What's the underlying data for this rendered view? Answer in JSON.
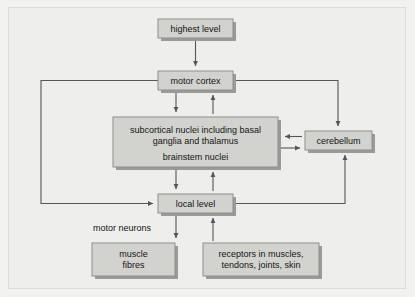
{
  "figure": {
    "background_color": "#eeeeec",
    "box_fill_color": "#d2d2cf",
    "box_border_color": "#8e8e8b",
    "box_shadow_color": "#9a9a97",
    "connector_color": "#55555a",
    "text_color": "#141414"
  },
  "nodes": {
    "highest_level": {
      "label": "highest level",
      "x": 158,
      "y": 19,
      "w": 75,
      "h": 19
    },
    "motor_cortex": {
      "label": "motor cortex",
      "x": 158,
      "y": 71,
      "w": 75,
      "h": 19
    },
    "subcortical": {
      "line1": "subcortical nuclei including basal",
      "line2": "ganglia and thalamus",
      "line3": "brainstem nuclei",
      "x": 113,
      "y": 117,
      "w": 165,
      "h": 50
    },
    "cerebellum": {
      "label": "cerebellum",
      "x": 305,
      "y": 131,
      "w": 67,
      "h": 19
    },
    "local_level": {
      "label": "local level",
      "x": 158,
      "y": 194,
      "w": 75,
      "h": 19
    },
    "muscle_fibres": {
      "line1": "muscle",
      "line2": "fibres",
      "x": 92,
      "y": 243,
      "w": 83,
      "h": 33
    },
    "receptors": {
      "line1": "receptors in muscles,",
      "line2": "tendons, joints, skin",
      "x": 203,
      "y": 243,
      "w": 116,
      "h": 33
    }
  },
  "edge_labels": {
    "motor_neurons": {
      "text": "motor neurons",
      "x": 122,
      "y": 228
    }
  },
  "connections": [
    {
      "from": "highest_level",
      "to": "motor_cortex",
      "kind": "arrow-down"
    },
    {
      "from": "motor_cortex",
      "to": "subcortical",
      "kind": "arrow-down"
    },
    {
      "from": "subcortical",
      "to": "motor_cortex",
      "kind": "arrow-up"
    },
    {
      "from": "subcortical",
      "to": "local_level",
      "kind": "arrow-down"
    },
    {
      "from": "local_level",
      "to": "subcortical",
      "kind": "arrow-up"
    },
    {
      "from": "motor_cortex",
      "to": "local_level",
      "kind": "left-bypass"
    },
    {
      "from": "motor_cortex",
      "to": "cerebellum",
      "kind": "right-down"
    },
    {
      "from": "local_level",
      "to": "cerebellum",
      "kind": "right-up"
    },
    {
      "from": "cerebellum",
      "to": "subcortical",
      "kind": "arrow-left"
    },
    {
      "from": "subcortical",
      "to": "cerebellum",
      "kind": "arrow-right"
    },
    {
      "from": "local_level",
      "to": "muscle_fibres",
      "kind": "arrow-down-motor-neurons"
    },
    {
      "from": "receptors",
      "to": "local_level",
      "kind": "arrow-up"
    }
  ]
}
